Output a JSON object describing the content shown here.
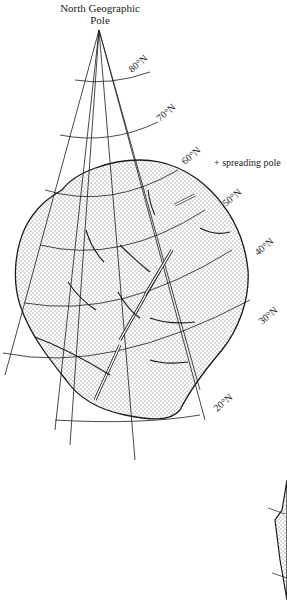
{
  "title": {
    "line1": "North Geographic",
    "line2": "Pole"
  },
  "latitude_labels": [
    "80°N",
    "70°N",
    "60°N",
    "50°N",
    "40°N",
    "30°N",
    "20°N"
  ],
  "annotation": "+ spreading pole",
  "colors": {
    "ink": "#1a1a1a",
    "stipple": "#555555",
    "background": "#ffffff"
  }
}
